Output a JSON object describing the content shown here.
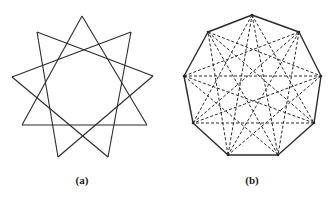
{
  "figures": [
    {
      "id": "a",
      "label": "(a)",
      "label_pos": [
        82,
        175
      ],
      "description": "Nine-pointed star formed by three overlapping triangles",
      "vertices": [
        [
          82,
          16
        ],
        [
          131,
          32
        ],
        [
          153,
          76
        ],
        [
          147,
          125
        ],
        [
          108,
          157
        ],
        [
          58,
          157
        ],
        [
          22,
          125
        ],
        [
          12,
          77
        ],
        [
          37,
          32
        ]
      ],
      "solid_skips": [
        3
      ],
      "dashed_skips": [],
      "outline": false
    },
    {
      "id": "b",
      "label": "(b)",
      "label_pos": [
        252,
        175
      ],
      "description": "Nonagon with dashed star diagonals",
      "vertices": [
        [
          252,
          15
        ],
        [
          299,
          32
        ],
        [
          321,
          76
        ],
        [
          314,
          123
        ],
        [
          278,
          155
        ],
        [
          228,
          155
        ],
        [
          193,
          123
        ],
        [
          184,
          76
        ],
        [
          208,
          32
        ]
      ],
      "solid_skips": [],
      "dashed_skips": [
        3,
        4
      ],
      "outline": true
    }
  ],
  "colors": {
    "stroke": "#2a2a2a",
    "background": "#ffffff"
  }
}
